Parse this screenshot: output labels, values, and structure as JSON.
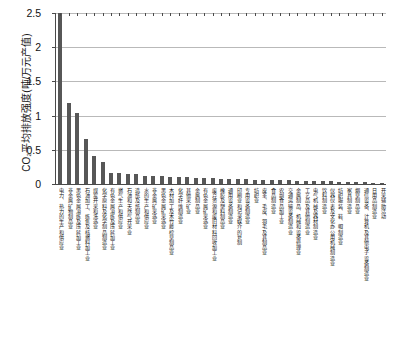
{
  "chart_data": {
    "type": "bar",
    "title": "",
    "xlabel": "",
    "ylabel": "CO₂平均排放强度(吨/万元产值)",
    "ylim": [
      0,
      2.5
    ],
    "ytick_labels": [
      "0",
      "0.5",
      "1",
      "1.5",
      "2",
      "2.5"
    ],
    "ytick_values": [
      0,
      0.5,
      1,
      1.5,
      2,
      2.5
    ],
    "grid": true,
    "legend": "none",
    "bar_color": "#575757",
    "axis_color": "#4a4a4a",
    "gridline_color": "#b9b9b9",
    "categories": [
      "电力、热力的生产和供应业",
      "非金属矿物制品业",
      "黑色金属冶炼及压延加工业",
      "石油加工、炼焦及核燃料加工业",
      "煤炭开采和洗选业",
      "化学原料及化学制品制造业",
      "有色金属冶炼及压延加工业",
      "燃气生产和供应业",
      "石油和天然气开采业",
      "造纸及纸制品业",
      "水的生产和供应业",
      "非金属矿采选业",
      "黑色金属矿采选业",
      "木材加工及木竹藤棕草制品业",
      "化学纤维制造业",
      "其他采矿业",
      "金属制品业",
      "有色金属矿采选业",
      "废弃资源和废旧材料回收加工业",
      "橡胶及塑料制品业",
      "通用设备制造业",
      "印刷业和记录媒介的复制",
      "专用设备制造业",
      "纺织业",
      "皮革、毛皮、羽毛及其制品业",
      "食品制造业",
      "农副食品加工业",
      "交通运输设备制造业",
      "金属制品、机械和设备修理业",
      "工艺品及其他制造业",
      "电气机械及器材制造业",
      "饮料制造业",
      "仪器仪表及文化办公用机械制造业",
      "纺织服装、鞋、帽制造业",
      "家具制造业",
      "烟草制品业",
      "通信设备、计算机及其他电子设备制造业",
      "日用品制造业",
      "开采辅助活动"
    ],
    "values": [
      2.5,
      1.19,
      1.04,
      0.655,
      0.405,
      0.325,
      0.165,
      0.162,
      0.15,
      0.148,
      0.122,
      0.118,
      0.112,
      0.105,
      0.1,
      0.096,
      0.09,
      0.086,
      0.082,
      0.078,
      0.074,
      0.07,
      0.067,
      0.064,
      0.061,
      0.058,
      0.055,
      0.052,
      0.049,
      0.046,
      0.043,
      0.04,
      0.037,
      0.034,
      0.031,
      0.028,
      0.025,
      0.021,
      0.016
    ]
  }
}
